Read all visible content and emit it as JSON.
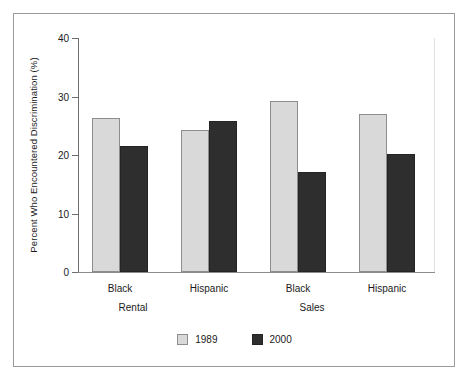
{
  "chart_data": {
    "type": "bar",
    "title": "",
    "xlabel": "",
    "ylabel": "Percent Who Encountered Discrimination (%)",
    "ylim": [
      0,
      40
    ],
    "yticks": [
      0,
      10,
      20,
      30,
      40
    ],
    "ytick_labels": [
      "0",
      "10",
      "20",
      "30",
      "40"
    ],
    "grid": false,
    "legend_position": "bottom-center",
    "categories": [
      "Black",
      "Hispanic",
      "Black",
      "Hispanic"
    ],
    "group_labels": [
      "Rental",
      "Sales"
    ],
    "series": [
      {
        "name": "1989",
        "color": "#d9d9d9",
        "values": [
          26.4,
          24.3,
          29.2,
          27.0
        ]
      },
      {
        "name": "2000",
        "color": "#2e2e2e",
        "values": [
          21.6,
          25.8,
          17.1,
          20.2
        ]
      }
    ]
  },
  "axis": {
    "y_title": "Percent Who Encountered Discrimination (%)",
    "y_tick_0": "0",
    "y_tick_1": "10",
    "y_tick_2": "20",
    "y_tick_3": "30",
    "y_tick_4": "40"
  },
  "categories": {
    "c0": "Black",
    "c1": "Hispanic",
    "c2": "Black",
    "c3": "Hispanic"
  },
  "supergroups": {
    "g0": "Rental",
    "g1": "Sales"
  },
  "legend": {
    "items": [
      {
        "label": "1989",
        "swatch": "light"
      },
      {
        "label": "2000",
        "swatch": "dark"
      }
    ],
    "label_0": "1989",
    "label_1": "2000"
  }
}
